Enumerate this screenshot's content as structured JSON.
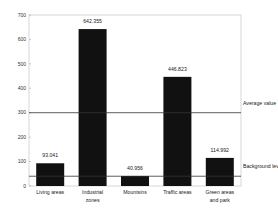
{
  "chart_data": {
    "type": "bar",
    "title": "",
    "xlabel": "",
    "ylabel": "",
    "ylim": [
      0,
      700
    ],
    "yticks": [
      0,
      100,
      200,
      300,
      400,
      500,
      600,
      700
    ],
    "grid": false,
    "categories": [
      [
        "Living areas"
      ],
      [
        "Industrial",
        "zones"
      ],
      [
        "Mountsins"
      ],
      [
        "Traffic areas"
      ],
      [
        "Green areas",
        "and park"
      ]
    ],
    "values": [
      93.041,
      642.355,
      40.956,
      446.823,
      114.992
    ],
    "value_labels": [
      "93.041",
      "642.355",
      "40.956",
      "446.823",
      "114.992"
    ],
    "reference_lines": [
      {
        "name": "Average value",
        "y": 300
      },
      {
        "name": "Background level",
        "y": 40
      }
    ],
    "bar_color": "#111111"
  }
}
